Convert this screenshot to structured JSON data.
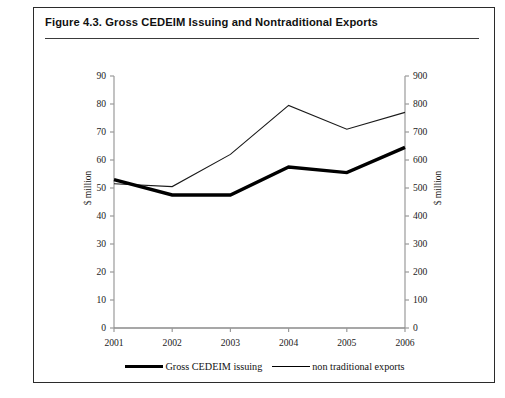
{
  "figure": {
    "title": "Figure 4.3. Gross CEDEIM Issuing and Nontraditional Exports"
  },
  "chart_data": {
    "type": "line",
    "title": "Figure 4.3. Gross CEDEIM Issuing and Nontraditional Exports",
    "xlabel": "",
    "ylabel": "$ million",
    "y2label": "$ million",
    "x": [
      "2001",
      "2002",
      "2003",
      "2004",
      "2005",
      "2006"
    ],
    "categories": [
      "2001",
      "2002",
      "2003",
      "2004",
      "2005",
      "2006"
    ],
    "ylim": [
      0,
      90
    ],
    "yticks": [
      0,
      10,
      20,
      30,
      40,
      50,
      60,
      70,
      80,
      90
    ],
    "y2lim": [
      0,
      900
    ],
    "y2ticks": [
      0,
      100,
      200,
      300,
      400,
      500,
      600,
      700,
      800,
      900
    ],
    "grid": false,
    "legend_position": "bottom",
    "series": [
      {
        "name": "Gross CEDEIM issuing",
        "axis": "left",
        "line_width": 3.4,
        "color": "#000000",
        "values": [
          53,
          47.5,
          47.5,
          57.5,
          55.5,
          64.5
        ]
      },
      {
        "name": "non traditional exports",
        "axis": "right",
        "line_width": 1.1,
        "color": "#1a1a1a",
        "values": [
          515,
          505,
          620,
          795,
          710,
          770
        ]
      }
    ]
  },
  "legend": {
    "items": [
      {
        "label": "Gross CEDEIM issuing",
        "style": "thick"
      },
      {
        "label": "non traditional exports",
        "style": "thin"
      }
    ]
  },
  "colors": {
    "frame": "#2b2b2b",
    "axis": "#8a8a8a",
    "series_thick": "#000000",
    "series_thin": "#1a1a1a",
    "background": "#ffffff"
  }
}
